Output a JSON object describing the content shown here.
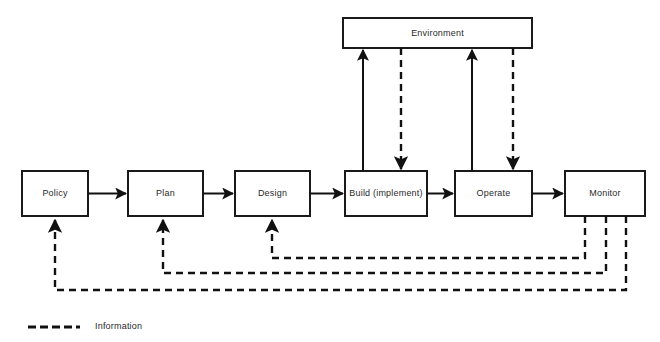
{
  "diagram": {
    "colors": {
      "stroke": "#111111",
      "box_stroke": "#1a1a1a",
      "box_fill": "#ffffff",
      "text": "#2a2a2a",
      "background": "#ffffff"
    },
    "nodes": [
      {
        "id": "policy",
        "label": "Policy",
        "x": 22,
        "y": 171,
        "w": 66,
        "h": 45
      },
      {
        "id": "plan",
        "label": "Plan",
        "x": 128,
        "y": 171,
        "w": 75,
        "h": 45
      },
      {
        "id": "design",
        "label": "Design",
        "x": 235,
        "y": 171,
        "w": 75,
        "h": 45
      },
      {
        "id": "build",
        "label": "Build (implement)",
        "x": 345,
        "y": 171,
        "w": 82,
        "h": 45
      },
      {
        "id": "operate",
        "label": "Operate",
        "x": 455,
        "y": 171,
        "w": 77,
        "h": 45
      },
      {
        "id": "monitor",
        "label": "Monitor",
        "x": 565,
        "y": 171,
        "w": 80,
        "h": 45
      },
      {
        "id": "environment",
        "label": "Environment",
        "x": 343,
        "y": 18,
        "w": 189,
        "h": 30
      }
    ],
    "solid_flows": [
      {
        "from": "policy",
        "to": "plan",
        "label": ""
      },
      {
        "from": "plan",
        "to": "design",
        "label": ""
      },
      {
        "from": "design",
        "to": "build",
        "label": ""
      },
      {
        "from": "build",
        "to": "operate",
        "label": ""
      },
      {
        "from": "operate",
        "to": "monitor",
        "label": ""
      },
      {
        "from": "build",
        "to": "environment",
        "label": ""
      },
      {
        "from": "operate",
        "to": "environment",
        "label": ""
      }
    ],
    "information_flows": [
      {
        "from": "environment",
        "to": "build",
        "label": ""
      },
      {
        "from": "environment",
        "to": "operate",
        "label": ""
      },
      {
        "from": "monitor",
        "to": "design",
        "label": ""
      },
      {
        "from": "monitor",
        "to": "plan",
        "label": ""
      },
      {
        "from": "monitor",
        "to": "policy",
        "label": ""
      }
    ]
  },
  "legend": {
    "items": [
      {
        "id": "information",
        "label": "Information",
        "style": "dashed"
      }
    ]
  }
}
